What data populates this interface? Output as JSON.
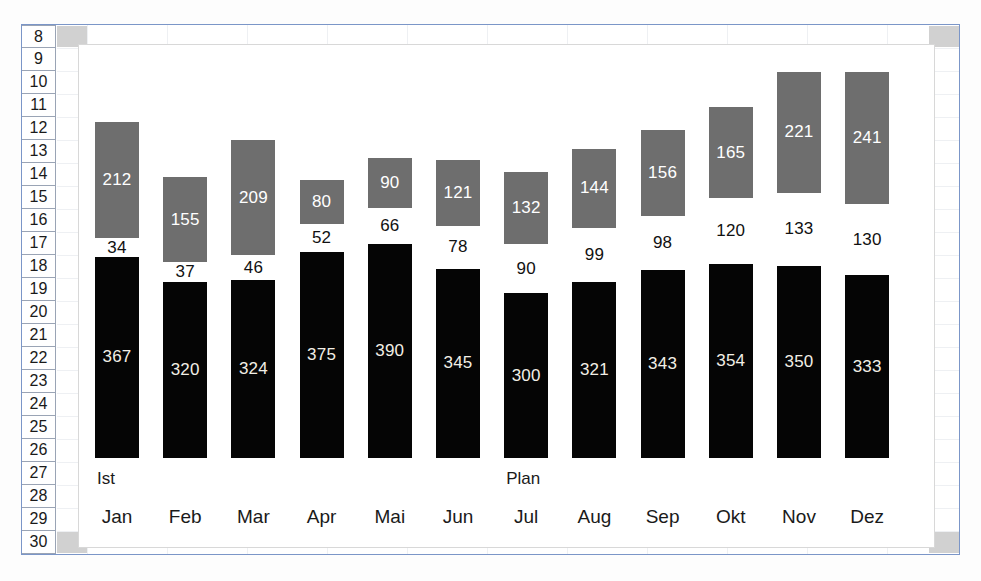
{
  "spreadsheet": {
    "row_headers": [
      "8",
      "9",
      "10",
      "11",
      "12",
      "13",
      "14",
      "15",
      "16",
      "17",
      "18",
      "19",
      "20",
      "21",
      "22",
      "23",
      "24",
      "25",
      "26",
      "27",
      "28",
      "29",
      "30"
    ],
    "selected_row_top": "8",
    "selected_row_bottom": "30"
  },
  "chart_data": {
    "type": "bar",
    "subtype": "stacked-column",
    "title": "",
    "xlabel": "",
    "ylabel": "",
    "grid": false,
    "legend_position": "inline-above-axis",
    "categories": [
      "Jan",
      "Feb",
      "Mar",
      "Apr",
      "Mai",
      "Jun",
      "Jul",
      "Aug",
      "Sep",
      "Okt",
      "Nov",
      "Dez"
    ],
    "annotations": [
      {
        "text": "Ist",
        "over_category": "Jan"
      },
      {
        "text": "Plan",
        "over_category": "Jul"
      }
    ],
    "series": [
      {
        "name": "Ist",
        "color": "#050505",
        "values": [
          367,
          320,
          324,
          375,
          390,
          345,
          300,
          321,
          343,
          354,
          350,
          333
        ]
      },
      {
        "name": "Spacer",
        "color": "#ffffff",
        "values": [
          34,
          37,
          46,
          52,
          66,
          78,
          90,
          99,
          98,
          120,
          133,
          130
        ]
      },
      {
        "name": "Plan",
        "color": "#6e6e6e",
        "values": [
          212,
          155,
          209,
          80,
          90,
          121,
          132,
          144,
          156,
          165,
          221,
          241
        ]
      }
    ],
    "ylim": [
      0,
      720
    ],
    "stack_order": [
      "Ist",
      "Spacer",
      "Plan"
    ]
  }
}
